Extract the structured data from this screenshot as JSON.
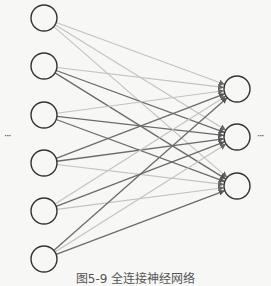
{
  "diagram": {
    "caption": "图5-9  全连接神经网络",
    "input_ellipsis": "···",
    "output_ellipsis": "···",
    "colors": {
      "background": "#f7f7f6",
      "node_stroke": "#333333",
      "edge_dark": "#6b6b6b",
      "edge_light": "#c2c2c2"
    },
    "node_radius": 13,
    "input_layer": {
      "x": 44,
      "nodes_y": [
        18,
        66,
        115,
        163,
        211,
        259
      ]
    },
    "output_layer": {
      "x": 237,
      "nodes_y": [
        89,
        137,
        186
      ]
    },
    "edges": [
      {
        "from": 0,
        "to": 0,
        "shade": "light"
      },
      {
        "from": 0,
        "to": 1,
        "shade": "light"
      },
      {
        "from": 0,
        "to": 2,
        "shade": "light"
      },
      {
        "from": 1,
        "to": 0,
        "shade": "light"
      },
      {
        "from": 1,
        "to": 1,
        "shade": "dark"
      },
      {
        "from": 1,
        "to": 2,
        "shade": "dark"
      },
      {
        "from": 2,
        "to": 0,
        "shade": "light"
      },
      {
        "from": 2,
        "to": 1,
        "shade": "dark"
      },
      {
        "from": 2,
        "to": 2,
        "shade": "dark"
      },
      {
        "from": 3,
        "to": 0,
        "shade": "dark"
      },
      {
        "from": 3,
        "to": 1,
        "shade": "dark"
      },
      {
        "from": 3,
        "to": 2,
        "shade": "light"
      },
      {
        "from": 4,
        "to": 0,
        "shade": "light"
      },
      {
        "from": 4,
        "to": 1,
        "shade": "dark"
      },
      {
        "from": 4,
        "to": 2,
        "shade": "light"
      },
      {
        "from": 5,
        "to": 0,
        "shade": "dark"
      },
      {
        "from": 5,
        "to": 1,
        "shade": "light"
      },
      {
        "from": 5,
        "to": 2,
        "shade": "dark"
      }
    ]
  }
}
